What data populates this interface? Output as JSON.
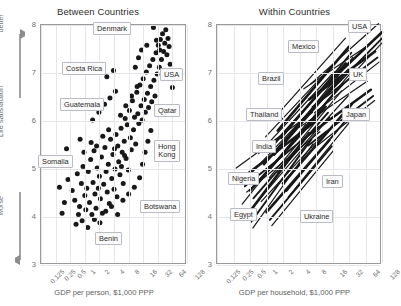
{
  "figure": {
    "background": "#ffffff",
    "ink_color": "#181818",
    "grid_color": "#e4e6ea",
    "axis_color": "#9a9a9a"
  },
  "vertical_axis": {
    "top_word": "better",
    "middle_word": "Life satisfaction",
    "bottom_word": "worse"
  },
  "panels": [
    {
      "id": "between",
      "title": "Between Countries",
      "xlabel": "GDP per person, $1,000 PPP",
      "ylabel": "Life satisfaction",
      "yticks": [
        "8",
        "7",
        "6",
        "5",
        "4",
        "3"
      ],
      "xticks": [
        "0.125",
        "0.25",
        "0.5",
        "1",
        "2",
        "4",
        "8",
        "16",
        "32",
        "64",
        "128"
      ],
      "callouts": [
        {
          "label": "Denmark",
          "x": 93,
          "y": 22
        },
        {
          "label": "Costa Rica",
          "x": 62,
          "y": 62
        },
        {
          "label": "Guatemala",
          "x": 60,
          "y": 98
        },
        {
          "label": "Somalia",
          "x": 38,
          "y": 155
        },
        {
          "label": "USA",
          "x": 160,
          "y": 68
        },
        {
          "label": "Qatar",
          "x": 154,
          "y": 104
        },
        {
          "label": "Hong\nKong",
          "x": 154,
          "y": 140
        },
        {
          "label": "Botswana",
          "x": 140,
          "y": 200
        },
        {
          "label": "Benin",
          "x": 95,
          "y": 232
        }
      ]
    },
    {
      "id": "within",
      "title": "Within Countries",
      "xlabel": "GDP per household, $1,000 PPP",
      "ylabel": "Life satisfaction",
      "yticks": [
        "8",
        "7",
        "6",
        "5",
        "4",
        "3"
      ],
      "xticks": [
        "0.125",
        "0.25",
        "0.5",
        "1",
        "2",
        "4",
        "8",
        "16",
        "32",
        "64",
        "128"
      ],
      "callouts": [
        {
          "label": "USA",
          "x": 152,
          "y": 20
        },
        {
          "label": "Mexico",
          "x": 92,
          "y": 40
        },
        {
          "label": "Brazil",
          "x": 62,
          "y": 72
        },
        {
          "label": "UK",
          "x": 153,
          "y": 68
        },
        {
          "label": "Thailand",
          "x": 50,
          "y": 108
        },
        {
          "label": "Japan",
          "x": 146,
          "y": 108
        },
        {
          "label": "India",
          "x": 56,
          "y": 140
        },
        {
          "label": "Nigeria",
          "x": 32,
          "y": 172
        },
        {
          "label": "Iran",
          "x": 126,
          "y": 175
        },
        {
          "label": "Egypt",
          "x": 34,
          "y": 208
        },
        {
          "label": "Ukraine",
          "x": 104,
          "y": 210
        }
      ]
    }
  ],
  "chart_data": [
    {
      "type": "scatter",
      "title": "Between Countries",
      "xlabel": "GDP per person, $1,000 PPP",
      "ylabel": "Life satisfaction",
      "xscale": "log2",
      "xlim": [
        0.125,
        128
      ],
      "ylim": [
        3,
        8
      ],
      "xticks": [
        0.125,
        0.25,
        0.5,
        1,
        2,
        4,
        8,
        16,
        32,
        64,
        128
      ],
      "yticks": [
        3,
        4,
        5,
        6,
        7,
        8
      ],
      "grid": true,
      "legend": "none",
      "annotations": [
        "Denmark",
        "Costa Rica",
        "Guatemala",
        "Somalia",
        "USA",
        "Qatar",
        "Hong Kong",
        "Botswana",
        "Benin"
      ],
      "points": [
        [
          0.55,
          4.55
        ],
        [
          0.62,
          4.35
        ],
        [
          0.7,
          4.9
        ],
        [
          0.78,
          4.22
        ],
        [
          0.85,
          4.7
        ],
        [
          0.92,
          5.05
        ],
        [
          1.0,
          4.45
        ],
        [
          1.05,
          4.15
        ],
        [
          1.1,
          4.6
        ],
        [
          1.18,
          4.95
        ],
        [
          1.25,
          4.3
        ],
        [
          1.32,
          5.2
        ],
        [
          1.4,
          4.05
        ],
        [
          1.48,
          4.72
        ],
        [
          1.55,
          5.38
        ],
        [
          1.62,
          4.48
        ],
        [
          1.7,
          4.18
        ],
        [
          1.8,
          5.02
        ],
        [
          1.9,
          4.6
        ],
        [
          2.0,
          4.85
        ],
        [
          2.1,
          4.38
        ],
        [
          2.2,
          5.25
        ],
        [
          2.3,
          4.08
        ],
        [
          2.45,
          4.68
        ],
        [
          2.6,
          5.45
        ],
        [
          2.75,
          4.95
        ],
        [
          2.9,
          4.52
        ],
        [
          3.05,
          5.1
        ],
        [
          3.2,
          4.28
        ],
        [
          3.4,
          5.62
        ],
        [
          3.6,
          4.8
        ],
        [
          3.8,
          5.3
        ],
        [
          4.0,
          4.58
        ],
        [
          4.2,
          5.0
        ],
        [
          4.4,
          5.72
        ],
        [
          4.6,
          4.42
        ],
        [
          4.8,
          5.48
        ],
        [
          5.0,
          5.15
        ],
        [
          5.3,
          4.88
        ],
        [
          5.6,
          5.85
        ],
        [
          5.9,
          5.35
        ],
        [
          6.2,
          4.7
        ],
        [
          6.5,
          5.58
        ],
        [
          6.8,
          6.05
        ],
        [
          7.1,
          5.22
        ],
        [
          7.5,
          5.92
        ],
        [
          7.9,
          4.98
        ],
        [
          8.3,
          6.22
        ],
        [
          8.7,
          5.65
        ],
        [
          9.1,
          5.4
        ],
        [
          9.6,
          6.42
        ],
        [
          10.1,
          5.82
        ],
        [
          10.6,
          6.08
        ],
        [
          11.2,
          5.52
        ],
        [
          11.8,
          6.6
        ],
        [
          12.4,
          6.15
        ],
        [
          13.0,
          5.95
        ],
        [
          13.7,
          6.75
        ],
        [
          14.4,
          6.32
        ],
        [
          15.2,
          6.02
        ],
        [
          16.0,
          6.88
        ],
        [
          16.8,
          6.45
        ],
        [
          17.7,
          6.18
        ],
        [
          18.6,
          7.02
        ],
        [
          19.6,
          6.58
        ],
        [
          20.6,
          6.28
        ],
        [
          21.7,
          7.15
        ],
        [
          22.8,
          6.72
        ],
        [
          24.0,
          6.4
        ],
        [
          25.3,
          7.28
        ],
        [
          26.6,
          6.85
        ],
        [
          28.0,
          6.52
        ],
        [
          29.5,
          7.42
        ],
        [
          31.0,
          6.98
        ],
        [
          32.7,
          7.58
        ],
        [
          34.4,
          7.12
        ],
        [
          36.2,
          7.7
        ],
        [
          38.1,
          7.28
        ],
        [
          40.1,
          7.82
        ],
        [
          42.2,
          7.45
        ],
        [
          44.5,
          7.62
        ],
        [
          46.8,
          7.9
        ],
        [
          49.3,
          7.38
        ],
        [
          51.9,
          7.72
        ],
        [
          54.6,
          7.55
        ],
        [
          57.5,
          7.18
        ],
        [
          60.5,
          6.92
        ],
        [
          64.0,
          6.7
        ],
        [
          68.0,
          7.05
        ],
        [
          0.45,
          4.78
        ],
        [
          0.38,
          4.3
        ],
        [
          0.5,
          5.12
        ],
        [
          0.66,
          3.85
        ],
        [
          0.74,
          4.05
        ],
        [
          0.88,
          3.92
        ],
        [
          0.96,
          5.35
        ],
        [
          1.15,
          3.78
        ],
        [
          1.35,
          5.55
        ],
        [
          1.58,
          3.95
        ],
        [
          1.75,
          5.48
        ],
        [
          2.05,
          3.88
        ],
        [
          2.35,
          5.68
        ],
        [
          2.7,
          4.12
        ],
        [
          3.1,
          5.82
        ],
        [
          3.55,
          4.22
        ],
        [
          4.1,
          5.42
        ],
        [
          4.75,
          4.05
        ],
        [
          5.45,
          6.12
        ],
        [
          6.1,
          4.35
        ],
        [
          7.0,
          6.32
        ],
        [
          8.0,
          4.48
        ],
        [
          9.2,
          6.52
        ],
        [
          10.5,
          4.62
        ],
        [
          12.0,
          6.72
        ],
        [
          13.5,
          4.82
        ],
        [
          15.5,
          5.1
        ],
        [
          17.5,
          5.35
        ],
        [
          20.0,
          5.58
        ],
        [
          23.0,
          5.8
        ],
        [
          0.3,
          4.62
        ],
        [
          0.34,
          4.08
        ],
        [
          1.45,
          6.02
        ],
        [
          1.95,
          6.18
        ],
        [
          2.55,
          6.35
        ],
        [
          3.3,
          6.48
        ],
        [
          4.3,
          6.62
        ],
        [
          5.7,
          5.05
        ],
        [
          6.6,
          5.28
        ],
        [
          11.0,
          7.12
        ],
        [
          12.8,
          7.32
        ],
        [
          14.8,
          7.48
        ],
        [
          19.0,
          7.58
        ],
        [
          26.0,
          7.95
        ],
        [
          30.0,
          7.68
        ],
        [
          35.0,
          7.48
        ],
        [
          45.0,
          7.05
        ],
        [
          0.42,
          5.42
        ],
        [
          0.8,
          5.62
        ],
        [
          2.85,
          6.92
        ],
        [
          3.9,
          7.05
        ]
      ]
    },
    {
      "type": "line",
      "title": "Within Countries",
      "xlabel": "GDP per household, $1,000 PPP",
      "ylabel": "Life satisfaction",
      "xscale": "log2",
      "xlim": [
        0.125,
        128
      ],
      "ylim": [
        3,
        8
      ],
      "xticks": [
        0.125,
        0.25,
        0.5,
        1,
        2,
        4,
        8,
        16,
        32,
        64,
        128
      ],
      "yticks": [
        3,
        4,
        5,
        6,
        7,
        8
      ],
      "grid": true,
      "legend": "none",
      "description": "Each line is one country's within-country income/life-satisfaction gradient; all slope upward to the right.",
      "series": [
        {
          "name": "USA",
          "x": [
            8.0,
            128.0
          ],
          "y": [
            6.55,
            7.85
          ]
        },
        {
          "name": "UK",
          "x": [
            6.0,
            96.0
          ],
          "y": [
            6.45,
            7.45
          ]
        },
        {
          "name": "Japan",
          "x": [
            5.0,
            80.0
          ],
          "y": [
            5.65,
            6.65
          ]
        },
        {
          "name": "Mexico",
          "x": [
            1.6,
            32.0
          ],
          "y": [
            5.8,
            7.55
          ]
        },
        {
          "name": "Brazil",
          "x": [
            1.2,
            28.0
          ],
          "y": [
            5.45,
            7.2
          ]
        },
        {
          "name": "Thailand",
          "x": [
            0.9,
            20.0
          ],
          "y": [
            5.1,
            6.85
          ]
        },
        {
          "name": "India",
          "x": [
            0.5,
            12.0
          ],
          "y": [
            4.55,
            6.3
          ]
        },
        {
          "name": "Nigeria",
          "x": [
            0.35,
            8.0
          ],
          "y": [
            4.8,
            6.0
          ]
        },
        {
          "name": "Egypt",
          "x": [
            0.45,
            6.0
          ],
          "y": [
            4.05,
            5.75
          ]
        },
        {
          "name": "Ukraine",
          "x": [
            1.0,
            14.0
          ],
          "y": [
            4.1,
            5.6
          ]
        },
        {
          "name": "Iran",
          "x": [
            2.0,
            36.0
          ],
          "y": [
            4.7,
            6.35
          ]
        }
      ]
    }
  ]
}
